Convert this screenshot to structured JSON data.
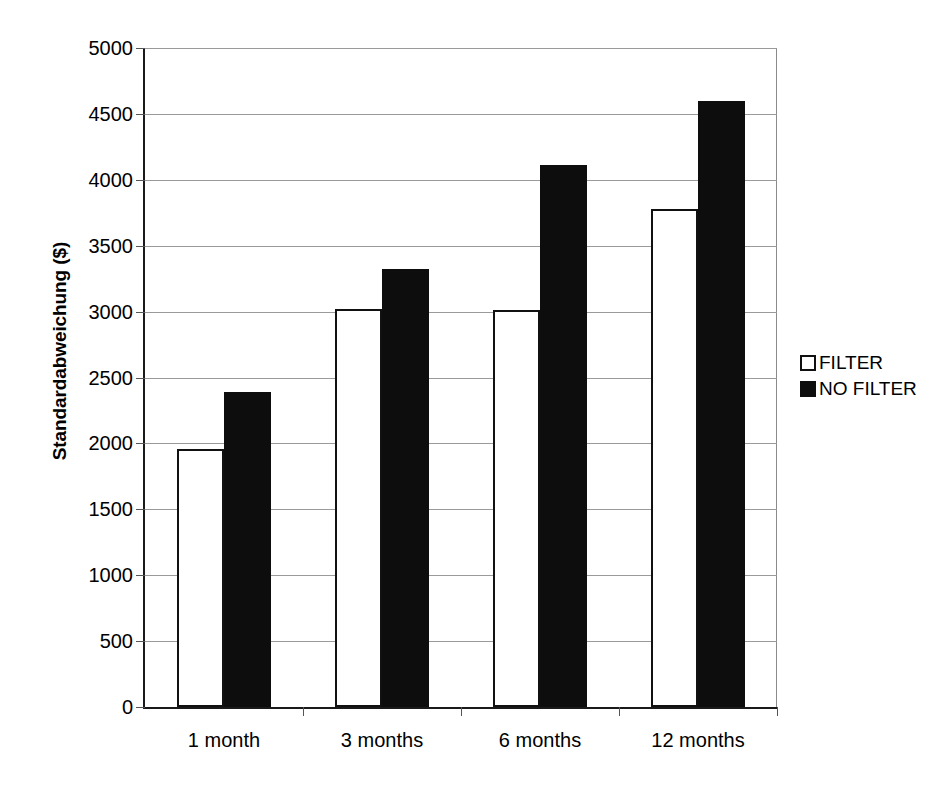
{
  "chart_data": {
    "type": "bar",
    "title": "",
    "xlabel": "",
    "ylabel": "Standardabweichung ($)",
    "categories": [
      "1 month",
      "3 months",
      "6 months",
      "12 months"
    ],
    "series": [
      {
        "name": "FILTER",
        "values": [
          1960,
          3020,
          3010,
          3780
        ]
      },
      {
        "name": "NO FILTER",
        "values": [
          2390,
          3320,
          4110,
          4600
        ]
      }
    ],
    "ylim": [
      0,
      5000
    ],
    "ytick_step": 500,
    "yticks": [
      0,
      500,
      1000,
      1500,
      2000,
      2500,
      3000,
      3500,
      4000,
      4500,
      5000
    ],
    "ytick_labels": [
      "0",
      "500",
      "1000",
      "1500",
      "2000",
      "2500",
      "3000",
      "3500",
      "4000",
      "4500",
      "5000"
    ],
    "grid": true,
    "grid_axis": "y",
    "legend_position": "right",
    "legend_entries": [
      {
        "label": "FILTER",
        "swatch": "hollow-square",
        "color": "#ffffff",
        "edge": "#111111"
      },
      {
        "label": "NO FILTER",
        "swatch": "filled-square",
        "color": "#0d0d0d",
        "edge": "#0d0d0d"
      }
    ],
    "background": "#ffffff",
    "axis_color": "#1a1a1a",
    "grid_color": "#9a9a9a"
  }
}
